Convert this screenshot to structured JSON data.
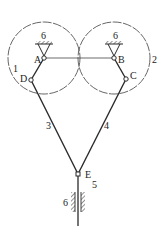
{
  "diagram": {
    "type": "linkage-mechanism",
    "colors": {
      "line": "#2a2a2a",
      "background": "#ffffff"
    },
    "joints": {
      "A": {
        "label": "A",
        "x": 44,
        "y": 58
      },
      "B": {
        "label": "B",
        "x": 114,
        "y": 58
      },
      "C": {
        "label": "C",
        "x": 126,
        "y": 79
      },
      "D": {
        "label": "D",
        "x": 31,
        "y": 80
      },
      "E": {
        "label": "E",
        "x": 78,
        "y": 174
      }
    },
    "links": {
      "link1": {
        "label": "1"
      },
      "link2": {
        "label": "2"
      },
      "link3": {
        "label": "3"
      },
      "link4": {
        "label": "4"
      },
      "link5": {
        "label": "5"
      }
    },
    "frames": {
      "ground_A": {
        "label": "6"
      },
      "ground_B": {
        "label": "6"
      },
      "ground_slider": {
        "label": "6"
      }
    }
  }
}
